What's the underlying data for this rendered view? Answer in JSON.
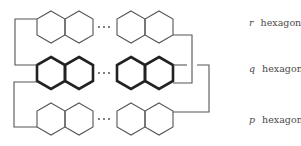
{
  "diagram": {
    "type": "hexagon-chain-structure",
    "rows": [
      {
        "id": "top",
        "label_var": "r",
        "label_text": "hexagons",
        "bold": false
      },
      {
        "id": "middle",
        "label_var": "q",
        "label_text": "hexagons",
        "bold": true
      },
      {
        "id": "bottom",
        "label_var": "p",
        "label_text": "hexagons",
        "bold": false
      }
    ],
    "ellipsis": "···",
    "colors": {
      "line": "#555555",
      "bold_line": "#222222",
      "text": "#4a4a4a",
      "background": "#ffffff"
    }
  }
}
